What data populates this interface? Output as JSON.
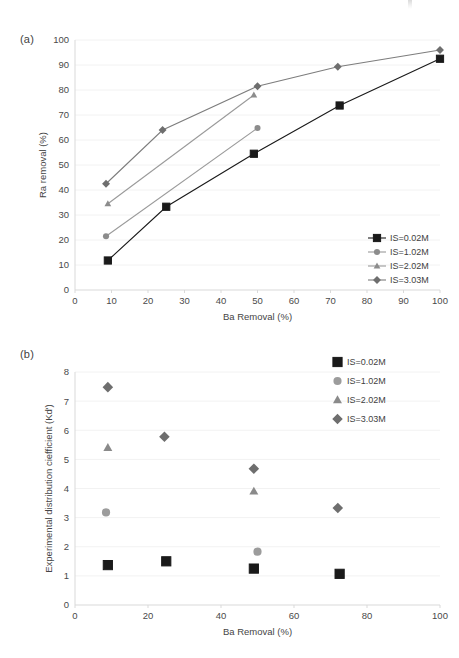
{
  "figure": {
    "panel_a_label": "(a)",
    "panel_b_label": "(b)"
  },
  "chart_data": [
    {
      "id": "panel-a",
      "type": "line",
      "title": "",
      "xlabel": "Ba Removal (%)",
      "ylabel": "Ra removal (%)",
      "xlim": [
        0,
        100
      ],
      "ylim": [
        0,
        100
      ],
      "xticks": [
        0,
        10,
        20,
        30,
        40,
        50,
        60,
        70,
        80,
        90,
        100
      ],
      "yticks": [
        0,
        10,
        20,
        30,
        40,
        50,
        60,
        70,
        80,
        90,
        100
      ],
      "grid": "horizontal",
      "legend_position": "inside-bottom-right",
      "series": [
        {
          "name": "IS=0.02M",
          "marker": "square",
          "color": "#1a1a1a",
          "line_color": "#1a1a1a",
          "x": [
            9,
            25,
            49,
            72.5,
            100
          ],
          "y": [
            11.8,
            33.3,
            54.5,
            73.8,
            92.5
          ]
        },
        {
          "name": "IS=1.02M",
          "marker": "circle",
          "color": "#8c8c8c",
          "line_color": "#9a9a9a",
          "x": [
            8.5,
            50
          ],
          "y": [
            21.5,
            64.8
          ]
        },
        {
          "name": "IS=2.02M",
          "marker": "triangle",
          "color": "#8c8c8c",
          "line_color": "#9a9a9a",
          "x": [
            9,
            49
          ],
          "y": [
            34.5,
            78
          ]
        },
        {
          "name": "IS=3.03M",
          "marker": "diamond",
          "color": "#6e6e6e",
          "line_color": "#7d7d7d",
          "x": [
            8.5,
            24,
            50,
            72,
            100
          ],
          "y": [
            42.5,
            64,
            81.5,
            89.3,
            96
          ]
        }
      ]
    },
    {
      "id": "panel-b",
      "type": "scatter",
      "title": "",
      "xlabel": "Ba Removal (%)",
      "ylabel": "Experimental distribution ciefficient (Kd')",
      "xlim": [
        0,
        100
      ],
      "ylim": [
        0,
        8
      ],
      "xticks": [
        0,
        20,
        40,
        60,
        80,
        100
      ],
      "yticks": [
        0,
        1,
        2,
        3,
        4,
        5,
        6,
        7,
        8
      ],
      "grid": "horizontal",
      "legend_position": "inside-top-right",
      "series": [
        {
          "name": "IS=0.02M",
          "marker": "square",
          "color": "#1a1a1a",
          "x": [
            9,
            25,
            49,
            72.5
          ],
          "y": [
            1.37,
            1.5,
            1.25,
            1.07
          ]
        },
        {
          "name": "IS=1.02M",
          "marker": "circle",
          "color": "#9c9c9c",
          "x": [
            8.5,
            50
          ],
          "y": [
            3.18,
            1.83
          ]
        },
        {
          "name": "IS=2.02M",
          "marker": "triangle",
          "color": "#8a8a8a",
          "x": [
            9,
            49
          ],
          "y": [
            5.4,
            3.9
          ]
        },
        {
          "name": "IS=3.03M",
          "marker": "diamond",
          "color": "#6e6e6e",
          "x": [
            9,
            24.5,
            49,
            72
          ],
          "y": [
            7.48,
            5.78,
            4.68,
            3.33
          ]
        }
      ]
    }
  ]
}
